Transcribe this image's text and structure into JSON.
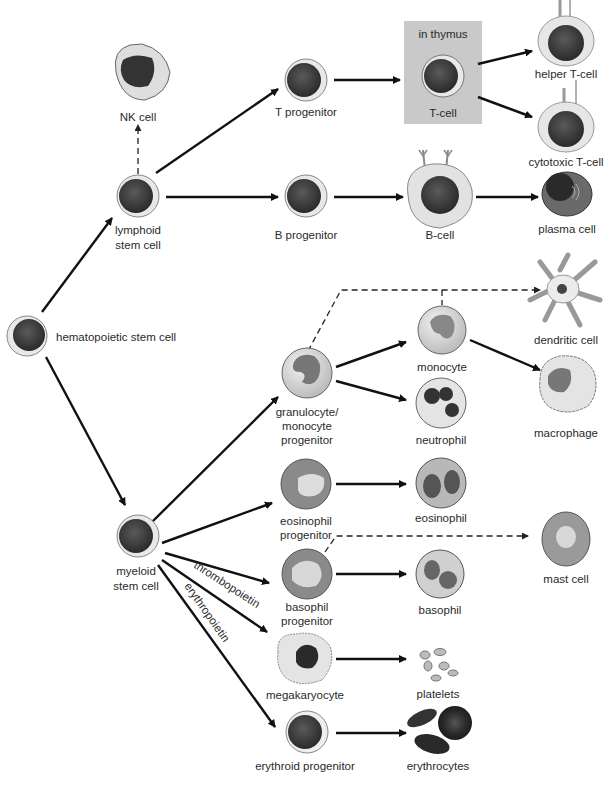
{
  "diagram": {
    "thymus_box_label": "in thymus",
    "annotations": {
      "thrombopoietin": "thrombopoietin",
      "erythropoietin": "erythropoietin"
    },
    "cells": {
      "hsc": "hematopoietic stem cell",
      "lymphoid_1": "lymphoid",
      "lymphoid_2": "stem cell",
      "nk": "NK cell",
      "t_prog": "T progenitor",
      "b_prog": "B progenitor",
      "t_cell": "T-cell",
      "b_cell": "B-cell",
      "helper_t": "helper T-cell",
      "cytotoxic_t": "cytotoxic T-cell",
      "plasma": "plasma cell",
      "myeloid_1": "myeloid",
      "myeloid_2": "stem cell",
      "gm_prog_1": "granulocyte/",
      "gm_prog_2": "monocyte",
      "gm_prog_3": "progenitor",
      "eos_prog_1": "eosinophil",
      "eos_prog_2": "progenitor",
      "baso_prog_1": "basophil",
      "baso_prog_2": "progenitor",
      "megakaryocyte": "megakaryocyte",
      "erythroid_prog": "erythroid progenitor",
      "monocyte": "monocyte",
      "neutrophil": "neutrophil",
      "eosinophil": "eosinophil",
      "basophil": "basophil",
      "platelets": "platelets",
      "erythrocytes": "erythrocytes",
      "dendritic": "dendritic cell",
      "macrophage": "macrophage",
      "mast": "mast cell"
    },
    "colors": {
      "nucleus_dark": "#3a3a3a",
      "cell_halo": "#e6e6e6",
      "thymus_box": "#c9c9c9",
      "arrow": "#111111"
    }
  }
}
